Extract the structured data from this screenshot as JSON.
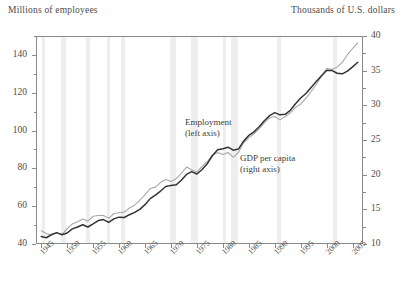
{
  "axis_captions": {
    "left": "Millions of employees",
    "right": "Thousands of U.S. dollars"
  },
  "annotations": {
    "employment": {
      "line1": "Employment",
      "line2": "(left axis)"
    },
    "gdp": {
      "line1": "GDP per capita",
      "line2": "(right axis)"
    }
  },
  "colors": {
    "employment_line": "#333333",
    "gdp_line": "#a8a8a8",
    "recession_band": "#ebebeb",
    "frame": "#8a8a8a",
    "text": "#4b4b4b"
  },
  "chart_data": {
    "type": "line",
    "title": "",
    "xlabel": "",
    "ylabel": "Millions of employees",
    "y2label": "Thousands of U.S. dollars",
    "grid": false,
    "legend": "inline-annotations",
    "xlim": [
      1944,
      2007
    ],
    "ylim": [
      40,
      150
    ],
    "y2lim": [
      10,
      40
    ],
    "y_ticks": [
      40,
      60,
      80,
      100,
      120,
      140
    ],
    "y_minor_ticks": [
      50,
      70,
      90,
      110,
      130,
      150
    ],
    "y2_ticks": [
      10,
      15,
      20,
      25,
      30,
      35,
      40
    ],
    "y2_minor_ticks": [
      12.5,
      17.5,
      22.5,
      27.5,
      32.5,
      37.5
    ],
    "x_ticks": [
      1945,
      1950,
      1955,
      1960,
      1965,
      1970,
      1975,
      1980,
      1985,
      1990,
      1995,
      2000,
      2005
    ],
    "x_tick_labels": [
      "1945",
      "1950",
      "1955",
      "1960",
      "1965",
      "1970",
      "1975",
      "1980",
      "1985",
      "1990",
      "1995",
      "2000",
      "2005"
    ],
    "recession_bands": [
      [
        1945.1,
        1945.8
      ],
      [
        1948.9,
        1949.8
      ],
      [
        1953.6,
        1954.4
      ],
      [
        1957.6,
        1958.3
      ],
      [
        1960.3,
        1961.1
      ],
      [
        1969.9,
        1970.9
      ],
      [
        1973.9,
        1975.2
      ],
      [
        1980.1,
        1980.6
      ],
      [
        1981.5,
        1982.9
      ],
      [
        1990.5,
        1991.2
      ],
      [
        2001.2,
        2001.9
      ]
    ],
    "series": [
      {
        "name": "Employment",
        "axis": "left",
        "units": "millions of employees",
        "color": "#333333",
        "x": [
          1945,
          1946,
          1947,
          1948,
          1949,
          1950,
          1951,
          1952,
          1953,
          1954,
          1955,
          1956,
          1957,
          1958,
          1959,
          1960,
          1961,
          1962,
          1963,
          1964,
          1965,
          1966,
          1967,
          1968,
          1969,
          1970,
          1971,
          1972,
          1973,
          1974,
          1975,
          1976,
          1977,
          1978,
          1979,
          1980,
          1981,
          1982,
          1983,
          1984,
          1985,
          1986,
          1987,
          1988,
          1989,
          1990,
          1991,
          1992,
          1993,
          1994,
          1995,
          1996,
          1997,
          1998,
          1999,
          2000,
          2001,
          2002,
          2003,
          2004,
          2005,
          2006
        ],
        "values": [
          44.0,
          43.3,
          45.0,
          46.0,
          44.9,
          45.8,
          48.0,
          49.0,
          50.2,
          49.0,
          50.6,
          52.4,
          52.9,
          51.4,
          53.3,
          54.2,
          54.0,
          55.5,
          56.7,
          58.3,
          60.8,
          64.0,
          65.9,
          68.0,
          70.4,
          71.0,
          71.3,
          73.7,
          76.8,
          78.3,
          77.0,
          79.4,
          82.5,
          86.8,
          89.9,
          90.4,
          91.2,
          89.6,
          90.2,
          94.4,
          97.4,
          99.3,
          102.0,
          105.2,
          107.9,
          109.5,
          108.3,
          108.6,
          110.7,
          114.2,
          117.2,
          119.6,
          122.7,
          125.9,
          129.0,
          131.8,
          131.8,
          130.3,
          130.0,
          131.4,
          133.7,
          136.1
        ]
      },
      {
        "name": "GDP per capita",
        "axis": "right",
        "units": "thousands of U.S. dollars",
        "color": "#a8a8a8",
        "x": [
          1945,
          1946,
          1947,
          1948,
          1949,
          1950,
          1951,
          1952,
          1953,
          1954,
          1955,
          1956,
          1957,
          1958,
          1959,
          1960,
          1961,
          1962,
          1963,
          1964,
          1965,
          1966,
          1967,
          1968,
          1969,
          1970,
          1971,
          1972,
          1973,
          1974,
          1975,
          1976,
          1977,
          1978,
          1979,
          1980,
          1981,
          1982,
          1983,
          1984,
          1985,
          1986,
          1987,
          1988,
          1989,
          1990,
          1991,
          1992,
          1993,
          1994,
          1995,
          1996,
          1997,
          1998,
          1999,
          2000,
          2001,
          2002,
          2003,
          2004,
          2005,
          2006
        ],
        "values": [
          11.9,
          11.5,
          11.3,
          11.6,
          11.4,
          12.2,
          12.9,
          13.2,
          13.6,
          13.3,
          14.0,
          14.1,
          14.1,
          13.7,
          14.4,
          14.5,
          14.6,
          15.2,
          15.6,
          16.3,
          17.1,
          18.0,
          18.2,
          18.9,
          19.3,
          19.0,
          19.4,
          20.2,
          21.1,
          20.7,
          20.4,
          21.2,
          21.9,
          22.8,
          23.2,
          22.9,
          23.2,
          22.5,
          23.2,
          24.6,
          25.3,
          25.9,
          26.6,
          27.5,
          28.2,
          28.4,
          27.9,
          28.4,
          28.9,
          29.7,
          30.2,
          31.0,
          32.0,
          33.0,
          34.2,
          35.3,
          35.2,
          35.5,
          36.2,
          37.3,
          38.2,
          39.0
        ]
      }
    ]
  }
}
